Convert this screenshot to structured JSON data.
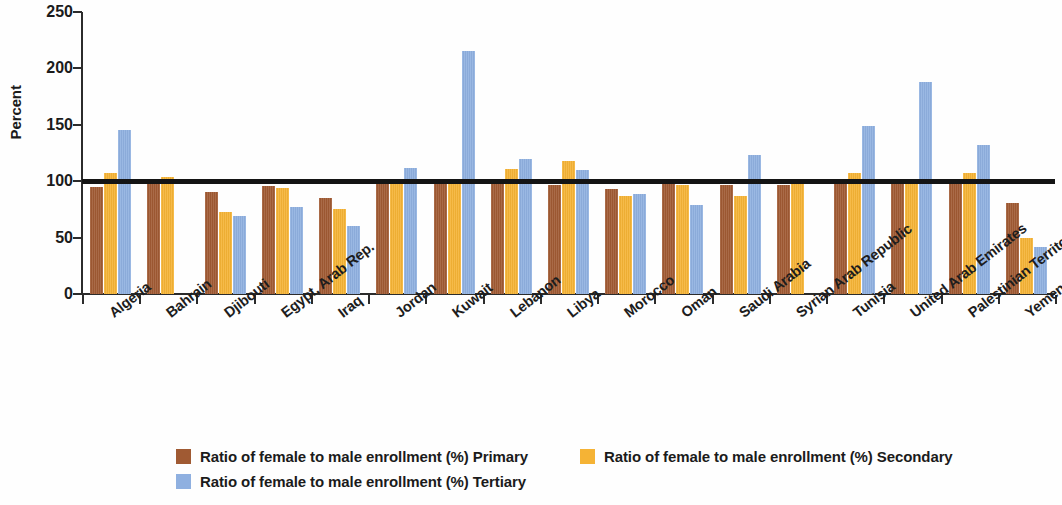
{
  "chart_data": {
    "type": "bar",
    "title": "",
    "xlabel": "",
    "ylabel": "Percent",
    "ylim": [
      0,
      250
    ],
    "yticks": [
      0,
      50,
      100,
      150,
      200,
      250
    ],
    "grid": false,
    "legend_position": "bottom",
    "reference_line": {
      "value": 100,
      "color": "#141414",
      "label": ""
    },
    "categories": [
      "Algeria",
      "Bahrain",
      "Djibouti",
      "Egypt, Arab Rep.",
      "Iraq",
      "Jordan",
      "Kuwait",
      "Lebanon",
      "Libya",
      "Morocco",
      "Oman",
      "Saudi Arabia",
      "Syrian Arab Republic",
      "Tunisia",
      "United Arab Emirates",
      "Palestinian Territories",
      "Yemen, Rep."
    ],
    "series": [
      {
        "name": "Ratio of female to male enrollment (%) Primary",
        "color": "#a05a33",
        "values": [
          95,
          101,
          90,
          96,
          85,
          101,
          100,
          100,
          97,
          93,
          100,
          97,
          97,
          100,
          100,
          100,
          81
        ]
      },
      {
        "name": "Ratio of female to male enrollment (%) Secondary",
        "color": "#f5b335",
        "values": [
          107,
          104,
          73,
          94,
          75,
          102,
          101,
          111,
          118,
          87,
          97,
          87,
          100,
          107,
          100,
          107,
          50
        ]
      },
      {
        "name": "Ratio of female to male enrollment (%) Tertiary",
        "color": "#8fb0e0",
        "values": [
          145,
          null,
          69,
          77,
          60,
          112,
          215,
          120,
          110,
          89,
          79,
          123,
          null,
          149,
          188,
          132,
          42
        ]
      }
    ]
  },
  "legend": {
    "items": [
      {
        "label": "Ratio of female to male enrollment (%) Primary",
        "color": "#a05a33"
      },
      {
        "label": "Ratio of female to male enrollment (%) Secondary",
        "color": "#f5b335"
      },
      {
        "label": "Ratio of female to male enrollment (%) Tertiary",
        "color": "#8fb0e0"
      }
    ]
  },
  "axis": {
    "y_title": "Percent",
    "y_tick_labels": [
      "250",
      "200",
      "150",
      "100",
      "50",
      "0"
    ]
  }
}
